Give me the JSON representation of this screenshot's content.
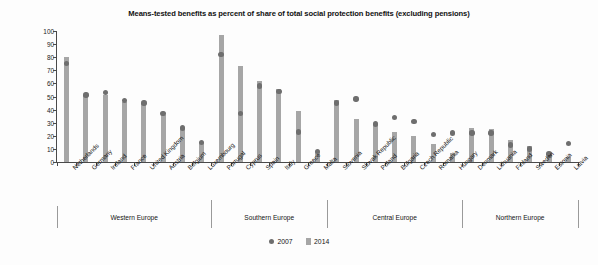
{
  "chart_data": {
    "type": "bar",
    "title": "Means-tested benefits as percent of share of total social protection benefits (excluding pensions)",
    "xlabel": "",
    "ylabel": "Percent of social protection benefits",
    "ylim": [
      0,
      100
    ],
    "yticks": [
      0,
      10,
      20,
      30,
      40,
      50,
      60,
      70,
      80,
      90,
      100
    ],
    "grid": false,
    "legend_position": "bottom",
    "categories": [
      "Netherlands",
      "Germany",
      "Ireland",
      "France",
      "United Kingdom",
      "Austria",
      "Belgium",
      "Luxembourg",
      "Portugal",
      "Cyprus",
      "Spain",
      "Italy",
      "Greece",
      "Malta",
      "Slovenia",
      "Slovak Republic",
      "Poland",
      "Bulgaria",
      "Czech Republic",
      "Romania",
      "Hungary",
      "Denmark",
      "Lithuania",
      "Finland",
      "Sweden",
      "Estonia",
      "Latvia"
    ],
    "series": [
      {
        "name": "2014",
        "marker": "bar",
        "color": "#a6a6a6",
        "values": [
          80,
          51,
          51,
          46,
          44,
          36,
          25,
          15,
          97,
          73,
          62,
          56,
          39,
          8,
          47,
          33,
          29,
          23,
          20,
          14,
          7,
          26,
          25,
          17,
          12,
          6,
          4
        ]
      },
      {
        "name": "2007",
        "marker": "dot",
        "color": "#6e6e6e",
        "values": [
          75,
          51,
          53,
          47,
          45,
          37,
          26,
          15,
          82,
          37,
          58,
          54,
          23,
          8,
          45,
          48,
          29,
          34,
          31,
          21,
          22,
          22,
          22,
          13,
          10,
          6,
          14
        ]
      }
    ],
    "groups": [
      {
        "label": "Western Europe",
        "start": 0,
        "end": 7
      },
      {
        "label": "Southern Europe",
        "start": 8,
        "end": 13
      },
      {
        "label": "Central Europe",
        "start": 14,
        "end": 20
      },
      {
        "label": "Northern Europe",
        "start": 21,
        "end": 26
      }
    ],
    "legend": [
      {
        "label": "2007",
        "marker": "dot"
      },
      {
        "label": "2014",
        "marker": "bar"
      }
    ]
  }
}
